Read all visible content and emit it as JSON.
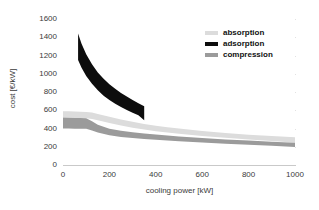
{
  "chart_data": {
    "type": "area",
    "title": "",
    "xlabel": "cooling power [kW]",
    "ylabel": "cost [€/kW]",
    "xlim": [
      0,
      1000
    ],
    "ylim": [
      0,
      1600
    ],
    "xticks": [
      "0",
      "200",
      "400",
      "600",
      "800",
      "1000"
    ],
    "yticks": [
      "0",
      "200",
      "400",
      "600",
      "800",
      "1000",
      "1200",
      "1400",
      "1600"
    ],
    "grid": true,
    "legend_position": "upper right",
    "series": [
      {
        "name": "absorption",
        "color": "#dcdcdc",
        "kind": "band",
        "x": [
          0,
          25,
          50,
          75,
          100,
          125,
          150,
          200,
          250,
          300,
          350,
          400,
          450,
          500,
          600,
          700,
          800,
          900,
          1000
        ],
        "upper": [
          590,
          588,
          586,
          584,
          582,
          575,
          560,
          530,
          500,
          473,
          450,
          430,
          415,
          400,
          372,
          350,
          332,
          317,
          305
        ],
        "lower": [
          520,
          518,
          516,
          514,
          512,
          505,
          490,
          460,
          432,
          408,
          388,
          370,
          355,
          342,
          318,
          298,
          280,
          262,
          245
        ]
      },
      {
        "name": "adsorption",
        "color": "#0d0d0d",
        "kind": "band",
        "x": [
          65,
          80,
          100,
          125,
          150,
          175,
          200,
          225,
          250,
          275,
          300,
          325,
          350
        ],
        "upper": [
          1440,
          1330,
          1215,
          1105,
          1015,
          945,
          885,
          835,
          790,
          750,
          712,
          678,
          645
        ],
        "lower": [
          1150,
          1065,
          975,
          890,
          818,
          760,
          712,
          672,
          635,
          602,
          572,
          545,
          490
        ]
      },
      {
        "name": "compression",
        "color": "#9b9b9b",
        "kind": "band",
        "x": [
          0,
          25,
          50,
          75,
          100,
          125,
          150,
          200,
          250,
          300,
          350,
          400,
          450,
          500,
          600,
          700,
          800,
          900,
          1000
        ],
        "upper": [
          520,
          518,
          516,
          515,
          513,
          480,
          440,
          398,
          375,
          358,
          345,
          333,
          322,
          312,
          295,
          280,
          268,
          256,
          245
        ],
        "lower": [
          400,
          399,
          398,
          397,
          396,
          378,
          355,
          325,
          308,
          296,
          285,
          276,
          268,
          261,
          247,
          234,
          222,
          210,
          198
        ]
      }
    ]
  },
  "legend": {
    "items": [
      {
        "label": "absorption",
        "color": "#dcdcdc"
      },
      {
        "label": "adsorption",
        "color": "#0d0d0d"
      },
      {
        "label": "compression",
        "color": "#9b9b9b"
      }
    ]
  },
  "axes": {
    "x_title": "cooling power [kW]",
    "y_title": "cost [€/kW]",
    "x_tick_labels": [
      "0",
      "200",
      "400",
      "600",
      "800",
      "1000"
    ],
    "y_tick_labels": [
      "1600",
      "1400",
      "1200",
      "1000",
      "800",
      "600",
      "400",
      "200",
      "0"
    ]
  }
}
